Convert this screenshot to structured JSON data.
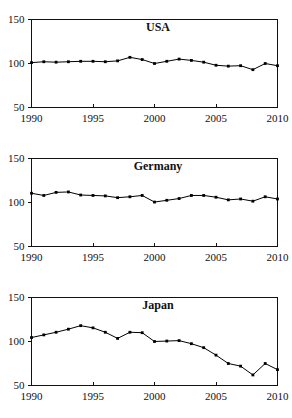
{
  "figure": {
    "panel_count": 3,
    "background_color": "#ffffff",
    "line_color": "#000000",
    "axis_color": "#111111"
  },
  "chart_data": [
    {
      "type": "line",
      "title": "USA",
      "xlabel": "",
      "ylabel": "",
      "xlim": [
        1990,
        2010
      ],
      "ylim": [
        50,
        150
      ],
      "grid": false,
      "legend": "none",
      "marker": "square",
      "x": [
        1990,
        1991,
        1992,
        1993,
        1994,
        1995,
        1996,
        1997,
        1998,
        1999,
        2000,
        2001,
        2002,
        2003,
        2004,
        2005,
        2006,
        2007,
        2008,
        2009,
        2010
      ],
      "xticks": [
        1990,
        1995,
        2000,
        2005,
        2010
      ],
      "xticklabels": [
        "1990",
        "1995",
        "2000",
        "2005",
        "2010"
      ],
      "yticks": [
        50,
        100,
        150
      ],
      "yticklabels": [
        "50",
        "100",
        "150"
      ],
      "values": [
        101,
        102,
        101.5,
        102,
        102.5,
        102.5,
        102,
        103,
        107,
        104.5,
        100,
        102.5,
        105,
        103.5,
        101.5,
        98,
        97,
        97.5,
        93,
        100,
        97.5
      ]
    },
    {
      "type": "line",
      "title": "Germany",
      "xlabel": "",
      "ylabel": "",
      "xlim": [
        1990,
        2010
      ],
      "ylim": [
        50,
        150
      ],
      "grid": false,
      "legend": "none",
      "marker": "square",
      "x": [
        1990,
        1991,
        1992,
        1993,
        1994,
        1995,
        1996,
        1997,
        1998,
        1999,
        2000,
        2001,
        2002,
        2003,
        2004,
        2005,
        2006,
        2007,
        2008,
        2009,
        2010
      ],
      "xticks": [
        1990,
        1995,
        2000,
        2005,
        2010
      ],
      "xticklabels": [
        "1990",
        "1995",
        "2000",
        "2005",
        "2010"
      ],
      "yticks": [
        50,
        100,
        150
      ],
      "yticklabels": [
        "50",
        "100",
        "150"
      ],
      "values": [
        110.5,
        108,
        111.5,
        112,
        108.5,
        108,
        107.5,
        105.5,
        106.5,
        108,
        100.5,
        102.5,
        104.5,
        108,
        108,
        106,
        103,
        104,
        101.5,
        106.5,
        104
      ]
    },
    {
      "type": "line",
      "title": "Japan",
      "xlabel": "",
      "ylabel": "",
      "xlim": [
        1990,
        2010
      ],
      "ylim": [
        50,
        150
      ],
      "grid": false,
      "legend": "none",
      "marker": "square",
      "x": [
        1990,
        1991,
        1992,
        1993,
        1994,
        1995,
        1996,
        1997,
        1998,
        1999,
        2000,
        2001,
        2002,
        2003,
        2004,
        2005,
        2006,
        2007,
        2008,
        2009,
        2010
      ],
      "xticks": [
        1990,
        1995,
        2000,
        2005,
        2010
      ],
      "xticklabels": [
        "1990",
        "1995",
        "2000",
        "2005",
        "2010"
      ],
      "yticks": [
        50,
        100,
        150
      ],
      "yticklabels": [
        "50",
        "100",
        "150"
      ],
      "values": [
        104.5,
        107.5,
        110.5,
        114,
        118,
        115.5,
        110.5,
        103.5,
        110.5,
        110,
        100,
        100.5,
        101,
        97.5,
        93,
        84.5,
        75,
        72,
        62,
        75,
        68
      ]
    }
  ]
}
